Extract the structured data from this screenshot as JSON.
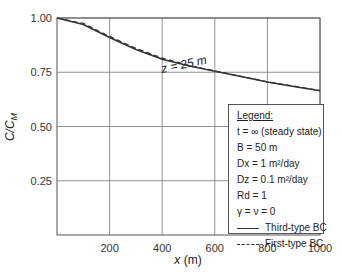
{
  "chart_data": {
    "type": "line",
    "title": "",
    "xlabel": "x (m)",
    "ylabel": "C/C_M",
    "xlim": [
      0,
      1000
    ],
    "ylim": [
      0,
      1.0
    ],
    "grid": true,
    "x_ticks": [
      "200",
      "400",
      "600",
      "800",
      "1000"
    ],
    "y_ticks": [
      "1.00",
      "0.75",
      "0.50",
      "0.25"
    ],
    "annotation": "z = 25 m",
    "legend_position": "lower right",
    "x": [
      0,
      100,
      200,
      300,
      400,
      500,
      600,
      700,
      800,
      900,
      1000
    ],
    "series": [
      {
        "name": "Third-type BC",
        "style": "solid",
        "values": [
          1.0,
          0.97,
          0.91,
          0.855,
          0.81,
          0.78,
          0.755,
          0.73,
          0.705,
          0.685,
          0.665
        ]
      },
      {
        "name": "First-type BC",
        "style": "dashed",
        "values": [
          1.0,
          0.975,
          0.915,
          0.86,
          0.815,
          0.782,
          0.756,
          0.731,
          0.706,
          0.686,
          0.666
        ]
      }
    ]
  },
  "legend": {
    "title": "Legend:",
    "items": [
      "t = ∞ (steady state)",
      "B = 50 m",
      "Dx = 1 m²/day",
      "Dz = 0.1 m²/day",
      "Rd = 1",
      "γ = ν = 0",
      "Third-type BC",
      "First-type BC"
    ]
  }
}
